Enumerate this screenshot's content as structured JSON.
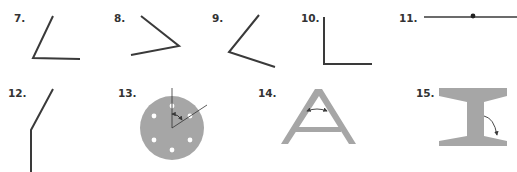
{
  "colors": {
    "line": "#3a3a3a",
    "shape_fill": "#a6a6a6",
    "label": "#333333",
    "hole": "#ffffff"
  },
  "figures": [
    {
      "label": "7.",
      "type": "angle",
      "description": "acute angle opening right"
    },
    {
      "label": "8.",
      "type": "angle",
      "description": "acute angle opening left"
    },
    {
      "label": "9.",
      "type": "angle",
      "description": "obtuse-ish angle opening right"
    },
    {
      "label": "10.",
      "type": "angle",
      "description": "right angle"
    },
    {
      "label": "11.",
      "type": "angle",
      "description": "straight angle with vertex point"
    },
    {
      "label": "12.",
      "type": "angle",
      "description": "reflex/obtuse angle bent line"
    },
    {
      "label": "13.",
      "type": "shape",
      "description": "circular plate with six holes and marked angle"
    },
    {
      "label": "14.",
      "type": "shape",
      "description": "A-frame with marked angle at apex region"
    },
    {
      "label": "15.",
      "type": "shape",
      "description": "I-beam cross section with marked angle"
    }
  ]
}
